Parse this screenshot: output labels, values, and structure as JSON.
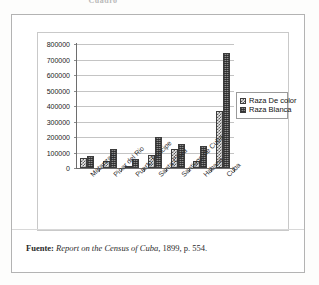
{
  "page": {
    "clipped_title": "Cuadro",
    "caption_label": "Fuente:",
    "caption_source_italic": "Report on the Census of Cuba",
    "caption_rest": ", 1899, p. 554."
  },
  "legend": {
    "position": "right",
    "items": [
      {
        "label": "Raza De color",
        "swatch": "checkered-swatch"
      },
      {
        "label": "Raza Blanca",
        "swatch": "dotted-swatch"
      }
    ]
  },
  "chart_data": {
    "type": "bar",
    "title": "",
    "xlabel": "",
    "ylabel": "",
    "ylim": [
      0,
      800000
    ],
    "ytick_step": 100000,
    "grid": true,
    "legend_position": "right",
    "categories": [
      "Matanzas",
      "Pinar del Rio",
      "Puerto Principe",
      "Santa Clara",
      "Santiago de Cuba",
      "Habana",
      "Cuba"
    ],
    "ticks": [
      "0",
      "100000",
      "200000",
      "300000",
      "400000",
      "500000",
      "600000",
      "700000",
      "800000"
    ],
    "series": [
      {
        "name": "Raza De color",
        "values": [
          62000,
          48000,
          13000,
          82000,
          120000,
          45000,
          368000
        ]
      },
      {
        "name": "Raza Blanca",
        "values": [
          80000,
          125000,
          55000,
          200000,
          157000,
          140000,
          740000
        ]
      }
    ]
  }
}
